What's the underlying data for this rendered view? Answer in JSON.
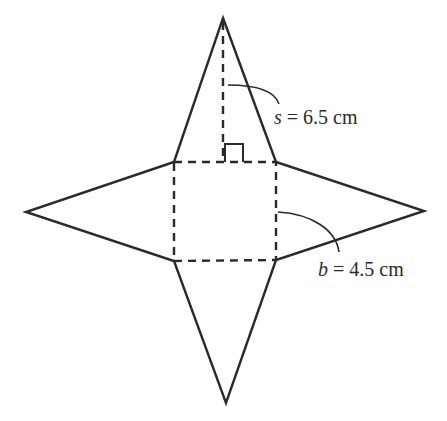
{
  "figure": {
    "labels": {
      "slant_height": {
        "variable": "s",
        "equals": " = ",
        "value": "6.5 cm"
      },
      "base_edge": {
        "variable": "b",
        "equals": " = ",
        "value": "4.5 cm"
      }
    },
    "colors": {
      "line": "#2a2a2a",
      "background": "#ffffff"
    }
  }
}
